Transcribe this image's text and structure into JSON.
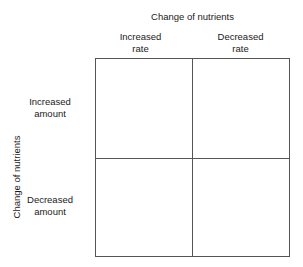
{
  "figure": {
    "type": "2x2-matrix",
    "top_axis_title": "Change of nutrients",
    "left_axis_title": "Change of nutrients",
    "columns": [
      {
        "line1": "Increased",
        "line2": "rate"
      },
      {
        "line1": "Decreased",
        "line2": "rate"
      }
    ],
    "rows": [
      {
        "line1": "Increased",
        "line2": "amount"
      },
      {
        "line1": "Decreased",
        "line2": "amount"
      }
    ],
    "cells": [
      {
        "row": 0,
        "col": 0,
        "text": ""
      },
      {
        "row": 0,
        "col": 1,
        "text": ""
      },
      {
        "row": 1,
        "col": 0,
        "text": ""
      },
      {
        "row": 1,
        "col": 1,
        "text": ""
      }
    ],
    "colors": {
      "background": "#ffffff",
      "line": "#555555",
      "text": "#1a1a1a"
    }
  }
}
